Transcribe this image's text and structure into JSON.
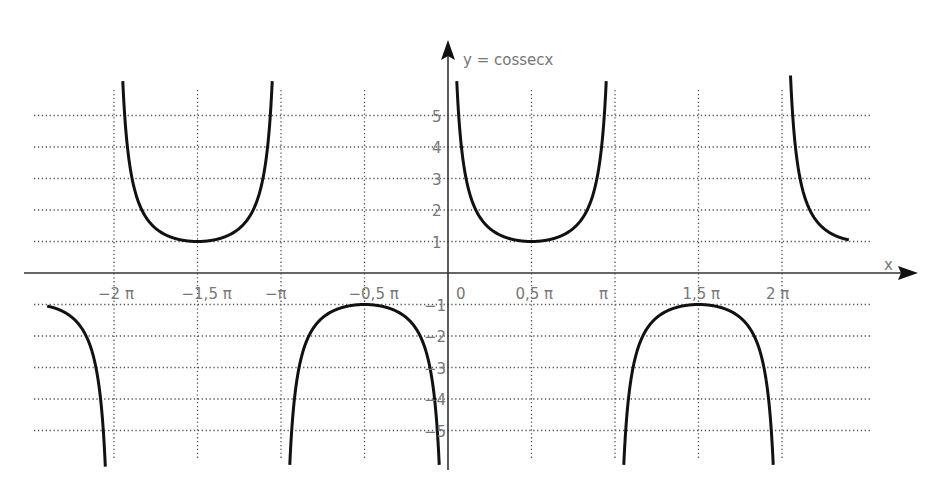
{
  "chart_data": {
    "type": "line",
    "title": "y = cossecx",
    "function": "y = csc(x)",
    "xlabel": "x",
    "ylabel": "y = cossecx",
    "x_tick_labels": [
      "−2 π",
      "−1,5 π",
      "−π",
      "−0,5 π",
      "0",
      "0,5 π",
      "π",
      "1,5 π",
      "2 π"
    ],
    "x_tick_values_in_pi": [
      -2,
      -1.5,
      -1,
      -0.5,
      0,
      0.5,
      1,
      1.5,
      2
    ],
    "y_tick_labels_positive": [
      "1",
      "2",
      "3",
      "4",
      "5"
    ],
    "y_tick_labels_negative": [
      "−1",
      "−2",
      "−3",
      "−4",
      "−5"
    ],
    "y_tick_values": [
      -5,
      -4,
      -3,
      -2,
      -1,
      1,
      2,
      3,
      4,
      5
    ],
    "xlim_in_pi": [
      -2.5,
      2.4
    ],
    "ylim": [
      -6.2,
      6.2
    ],
    "grid": true,
    "grid_style": "dotted",
    "asymptotes_in_pi": [
      -2,
      -1,
      0,
      1,
      2
    ],
    "local_extrema": [
      {
        "x": "-1.5π",
        "y": 1
      },
      {
        "x": "-0.5π",
        "y": -1
      },
      {
        "x": "0.5π",
        "y": 1
      },
      {
        "x": "1.5π",
        "y": -1
      }
    ],
    "series": [
      {
        "name": "csc(x)",
        "branches_in_pi": [
          [
            -2.4,
            -2.0
          ],
          [
            -2.0,
            -1.0
          ],
          [
            -1.0,
            0.0
          ],
          [
            0.0,
            1.0
          ],
          [
            1.0,
            2.0
          ],
          [
            2.0,
            2.4
          ]
        ]
      }
    ],
    "colors": {
      "curve": "#111111",
      "grid": "#555555",
      "axis": "#333333",
      "labels": "#777777"
    }
  },
  "layout": {
    "origin_x": 448,
    "origin_y": 273,
    "px_per_pi": 167,
    "px_per_unit_y": 31.5,
    "clip_top": 75,
    "clip_bottom": 468,
    "grid_left": 34,
    "grid_right": 872
  }
}
